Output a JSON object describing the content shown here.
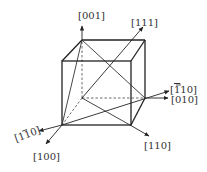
{
  "diagram": {
    "colors": {
      "line": "#222222",
      "text": "#333333",
      "background": "#ffffff"
    },
    "labels": {
      "d001": {
        "text": "[001]",
        "overbar_index": null
      },
      "d111": {
        "text": "[111]",
        "overbar_index": null
      },
      "d_110": {
        "pre": "[",
        "bar": "1",
        "post": "10]"
      },
      "d010": {
        "text": "[010]",
        "overbar_index": null
      },
      "d110": {
        "text": "[110]",
        "overbar_index": null
      },
      "d1_10": {
        "pre": "[1",
        "bar": "1",
        "post": "0]"
      },
      "d100": {
        "text": "[100]",
        "overbar_index": null
      }
    }
  }
}
